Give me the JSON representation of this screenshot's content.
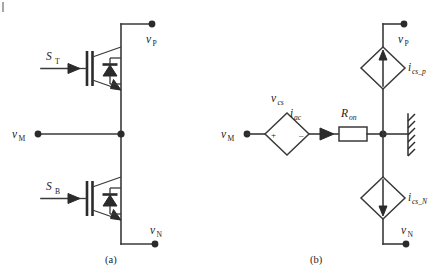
{
  "figure": {
    "panels": [
      {
        "id": "a",
        "caption": "(a)",
        "title": "half-bridge IGBT leg",
        "terminals": [
          {
            "name": "v_P",
            "base": "v",
            "sub": "P"
          },
          {
            "name": "v_M",
            "base": "v",
            "sub": "M"
          },
          {
            "name": "v_N",
            "base": "v",
            "sub": "N"
          }
        ],
        "gate_signals": [
          {
            "name": "S_T",
            "base": "S",
            "sub": "T"
          },
          {
            "name": "S_B",
            "base": "S",
            "sub": "B"
          }
        ],
        "devices": [
          {
            "type": "igbt",
            "position": "top",
            "gate_label": "S_T"
          },
          {
            "type": "antiparallel-diode",
            "position": "top"
          },
          {
            "type": "igbt",
            "position": "bottom",
            "gate_label": "S_B"
          },
          {
            "type": "antiparallel-diode",
            "position": "bottom"
          }
        ]
      },
      {
        "id": "b",
        "caption": "(b)",
        "title": "equivalent controlled-source model",
        "terminals": [
          {
            "name": "v_P",
            "base": "v",
            "sub": "P"
          },
          {
            "name": "v_M",
            "base": "v",
            "sub": "M"
          },
          {
            "name": "v_N",
            "base": "v",
            "sub": "N"
          }
        ],
        "elements": [
          {
            "type": "controlled-voltage-source",
            "base": "v",
            "sub": "cs",
            "plus": "+",
            "minus": "–"
          },
          {
            "type": "current-label",
            "base": "i",
            "sub": "ac"
          },
          {
            "type": "resistor",
            "base": "R",
            "sub": "on"
          },
          {
            "type": "controlled-current-source",
            "base": "i",
            "sub": "cs_p",
            "direction": "up"
          },
          {
            "type": "controlled-current-source",
            "base": "i",
            "sub": "cs_N",
            "direction": "down"
          },
          {
            "type": "chassis-ground",
            "name": "hatched-wall"
          }
        ]
      }
    ],
    "colors": {
      "wire": "#3a3a3a",
      "symbol": "#2b2b2b",
      "text": "#1c1c1c",
      "background": "#ffffff"
    }
  }
}
